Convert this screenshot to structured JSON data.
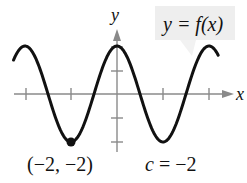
{
  "figure": {
    "function_label": "y = f(x)",
    "x_axis_label": "x",
    "y_axis_label": "y",
    "point_label": "(−2, −2)",
    "c_label": "c = −2",
    "colors": {
      "curve": "#111111",
      "axes": "#8a8a8a",
      "label_box": "#eeeeee",
      "point": "#111111"
    }
  },
  "chart_data": {
    "type": "line",
    "title": "y = f(x)",
    "xlabel": "x",
    "ylabel": "y",
    "function": "f(x) = 2cos(πx/2)",
    "x_ticks": [
      -4,
      -2,
      0,
      2,
      4
    ],
    "y_ticks": [
      -2,
      -1,
      1,
      2
    ],
    "xlim": [
      -4.5,
      4.5
    ],
    "ylim": [
      -2.3,
      2.8
    ],
    "grid": false,
    "highlighted_point": {
      "x": -2,
      "y": -2,
      "label": "(−2, −2)"
    },
    "annotation": "c = −2",
    "series": [
      {
        "name": "y = f(x)",
        "x": [
          -4.5,
          -4,
          -3.5,
          -3,
          -2.5,
          -2,
          -1.5,
          -1,
          -0.5,
          0,
          0.5,
          1,
          1.5,
          2,
          2.5,
          3,
          3.5,
          4,
          4.4
        ],
        "y": [
          1.41,
          2,
          1.41,
          0,
          -1.41,
          -2,
          -1.41,
          0,
          1.41,
          2,
          1.41,
          0,
          -1.41,
          -2,
          -1.41,
          0,
          1.41,
          2,
          1.62
        ]
      }
    ]
  }
}
